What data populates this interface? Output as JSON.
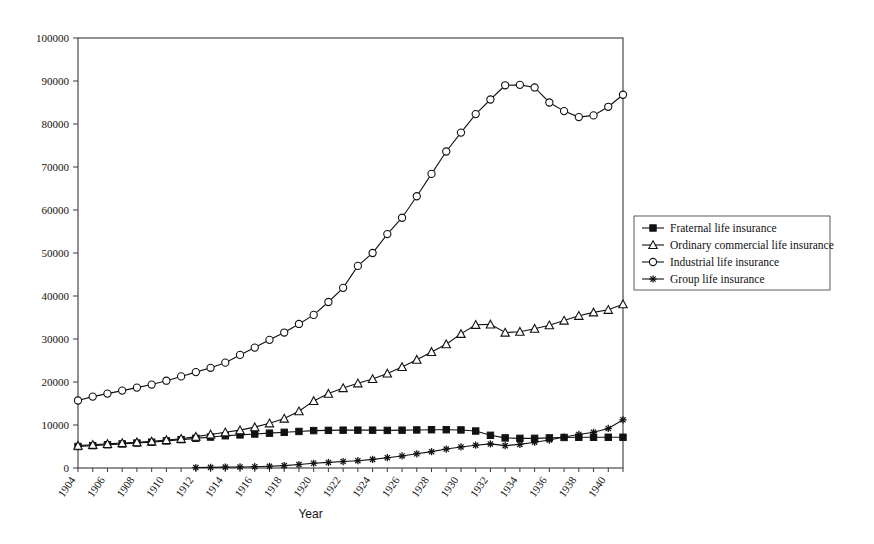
{
  "chart_data": {
    "type": "line",
    "title": "",
    "xlabel": "Year",
    "ylabel": "",
    "xlim": [
      1904,
      1941
    ],
    "ylim": [
      0,
      100000
    ],
    "ytick_step": 10000,
    "xtick_step": 1,
    "xticklabel_step": 2,
    "grid": false,
    "legend_position": "right",
    "yticks": [
      0,
      10000,
      20000,
      30000,
      40000,
      50000,
      60000,
      70000,
      80000,
      90000,
      100000
    ],
    "ytick_labels": [
      "0",
      "10000",
      "20000",
      "30000",
      "40000",
      "50000",
      "60000",
      "70000",
      "80000",
      "90000",
      "100000"
    ],
    "x": [
      1904,
      1905,
      1906,
      1907,
      1908,
      1909,
      1910,
      1911,
      1912,
      1913,
      1914,
      1915,
      1916,
      1917,
      1918,
      1919,
      1920,
      1921,
      1922,
      1923,
      1924,
      1925,
      1926,
      1927,
      1928,
      1929,
      1930,
      1931,
      1932,
      1933,
      1934,
      1935,
      1936,
      1937,
      1938,
      1939,
      1940,
      1941
    ],
    "xtick_labels": [
      "1904",
      "1906",
      "1908",
      "1910",
      "1912",
      "1914",
      "1916",
      "1918",
      "1920",
      "1922",
      "1924",
      "1926",
      "1928",
      "1930",
      "1932",
      "1934",
      "1936",
      "1938",
      "1940"
    ],
    "series": [
      {
        "name": "Fraternal life insurance",
        "marker": "filled-square",
        "values": [
          5000,
          5200,
          5400,
          5600,
          5800,
          6000,
          6300,
          6600,
          6900,
          7200,
          7500,
          7700,
          7900,
          8100,
          8300,
          8500,
          8700,
          8750,
          8800,
          8800,
          8800,
          8750,
          8800,
          8850,
          8900,
          8900,
          8850,
          8600,
          7600,
          7000,
          6900,
          6900,
          7000,
          7100,
          7150,
          7150,
          7150,
          7150
        ]
      },
      {
        "name": "Ordinary commercial life insurance",
        "marker": "open-triangle",
        "values": [
          5200,
          5400,
          5600,
          5800,
          6000,
          6200,
          6500,
          6800,
          7300,
          7800,
          8300,
          8800,
          9500,
          10400,
          11500,
          13200,
          15600,
          17300,
          18600,
          19700,
          20700,
          22000,
          23500,
          25200,
          27000,
          28800,
          31200,
          33300,
          33400,
          31500,
          31700,
          32400,
          33200,
          34300,
          35400,
          36200,
          36800,
          38100
        ]
      },
      {
        "name": "Industrial life insurance",
        "marker": "open-circle",
        "values": [
          15700,
          16600,
          17300,
          18000,
          18700,
          19400,
          20300,
          21300,
          22300,
          23300,
          24500,
          26300,
          28000,
          29800,
          31500,
          33500,
          35600,
          38600,
          41900,
          47000,
          50000,
          54400,
          58200,
          63200,
          68400,
          73600,
          78000,
          82300,
          85700,
          89000,
          89100,
          88500,
          85000,
          83000,
          81600,
          82000,
          84000,
          86800
        ]
      },
      {
        "name": "Group life insurance",
        "marker": "star",
        "values": [
          null,
          null,
          null,
          null,
          null,
          null,
          null,
          null,
          100,
          150,
          200,
          250,
          300,
          400,
          550,
          800,
          1100,
          1300,
          1500,
          1700,
          2000,
          2400,
          2800,
          3300,
          3800,
          4400,
          4900,
          5300,
          5600,
          5200,
          5500,
          6000,
          6500,
          7200,
          7800,
          8300,
          9200,
          11200
        ]
      }
    ]
  },
  "legend": {
    "items": [
      {
        "label": "Fraternal life insurance"
      },
      {
        "label": "Ordinary commercial life insurance"
      },
      {
        "label": "Industrial life insurance"
      },
      {
        "label": "Group life insurance"
      }
    ]
  }
}
